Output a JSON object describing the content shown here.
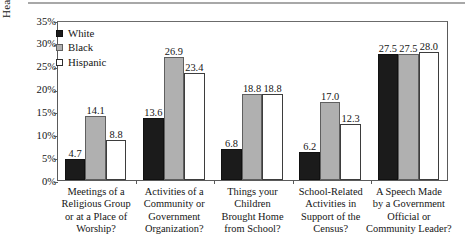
{
  "chart_data": {
    "type": "bar",
    "title": "",
    "subtitle": "",
    "xlabel": "",
    "ylabel": "Heard from the Group",
    "ylim": [
      0,
      35
    ],
    "y_tick_labels": [
      "35%",
      "30%",
      "25%",
      "20%",
      "15%",
      "10%",
      "5%",
      "0%"
    ],
    "y_tick_values": [
      35,
      30,
      25,
      20,
      15,
      10,
      5,
      0
    ],
    "grid": false,
    "legend_position": "top-left",
    "value_label_format": "one-decimal",
    "categories": [
      "Meetings of a Religious Group or at a Place of Worship?",
      "Activities of a Community or Government Organization?",
      "Things your Children Brought Home from School?",
      "School-Related Activities in Support of the Census?",
      "A Speech Made by a Government Official or Community Leader?"
    ],
    "category_lines": [
      [
        "Meetings of a",
        "Religious Group",
        "or at a Place of",
        "Worship?"
      ],
      [
        "Activities of a",
        "Community or",
        "Government",
        "Organization?"
      ],
      [
        "Things your",
        "Children",
        "Brought Home",
        "from School?"
      ],
      [
        "School-Related",
        "Activities in",
        "Support of the",
        "Census?"
      ],
      [
        "A Speech Made",
        "by a Government",
        "Official or",
        "Community Leader?"
      ]
    ],
    "series": [
      {
        "name": "White",
        "color": "#1b1b1b",
        "values": [
          4.7,
          13.6,
          6.8,
          6.2,
          27.5
        ],
        "labels": [
          "4.7",
          "13.6",
          "6.8",
          "6.2",
          "27.5"
        ]
      },
      {
        "name": "Black",
        "color": "#b0b0b0",
        "values": [
          14.1,
          26.9,
          18.8,
          17.0,
          27.5
        ],
        "labels": [
          "14.1",
          "26.9",
          "18.8",
          "17.0",
          "27.5"
        ]
      },
      {
        "name": "Hispanic",
        "color": "#ffffff",
        "values": [
          8.8,
          23.4,
          18.8,
          12.3,
          28.0
        ],
        "labels": [
          "8.8",
          "23.4",
          "18.8",
          "12.3",
          "28.0"
        ]
      }
    ]
  },
  "legend": {
    "entries": [
      {
        "label": "White",
        "swatch": "filled-black-square"
      },
      {
        "label": "Black",
        "swatch": "filled-gray-square"
      },
      {
        "label": "Hispanic",
        "swatch": "outlined-white-square"
      }
    ]
  },
  "axis": {
    "y_title": "Heard from the Group"
  }
}
